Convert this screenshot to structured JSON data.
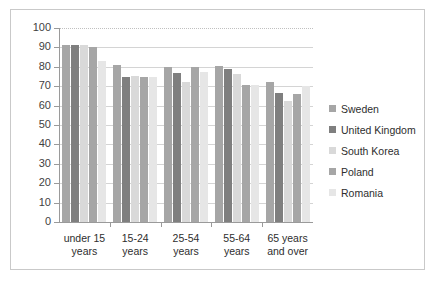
{
  "chart_data": {
    "type": "bar",
    "title": "",
    "xlabel": "",
    "ylabel": "",
    "ylim": [
      0,
      100
    ],
    "ytick_step": 10,
    "yticks": [
      100,
      90,
      80,
      70,
      60,
      50,
      40,
      30,
      20,
      10,
      0
    ],
    "grid": true,
    "legend_position": "right",
    "categories": [
      "under 15 years",
      "15-24 years",
      "25-54 years",
      "55-64 years",
      "65 years and over"
    ],
    "series": [
      {
        "name": "Sweden",
        "color": "#a6a6a6",
        "values": [
          91.5,
          81,
          80,
          80.5,
          72
        ]
      },
      {
        "name": "United Kingdom",
        "color": "#7f7f7f",
        "values": [
          91.5,
          75,
          77,
          79,
          66.5
        ]
      },
      {
        "name": "South Korea",
        "color": "#d9d9d9",
        "values": [
          91.5,
          75.5,
          72,
          76.5,
          62.5
        ]
      },
      {
        "name": "Poland",
        "color": "#a6a6a6",
        "values": [
          90,
          75,
          80,
          70.5,
          66
        ]
      },
      {
        "name": "Romania",
        "color": "#e6e6e6",
        "values": [
          83,
          74.5,
          77.5,
          70.5,
          70
        ]
      }
    ]
  },
  "legend": {
    "items": [
      {
        "label": "Sweden"
      },
      {
        "label": "United Kingdom"
      },
      {
        "label": "South Korea"
      },
      {
        "label": "Poland"
      },
      {
        "label": "Romania"
      }
    ]
  },
  "colors": {
    "frame_border": "#c9c9c9",
    "gridline": "#d4d4d4",
    "axis": "#9a9a9a",
    "text": "#2e2e2e"
  }
}
